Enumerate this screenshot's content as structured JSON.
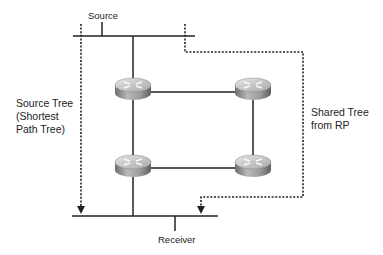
{
  "diagram": {
    "source_label": "Source",
    "receiver_label": "Receiver",
    "source_tree_label": [
      "Source Tree",
      "(Shortest",
      "Path Tree)"
    ],
    "shared_tree_label": [
      "Shared Tree",
      "from RP"
    ],
    "routers": [
      {
        "id": "router-top-left"
      },
      {
        "id": "router-top-right"
      },
      {
        "id": "router-bottom-left"
      },
      {
        "id": "router-bottom-right"
      }
    ],
    "colors": {
      "line": "#222222",
      "router_top": "#d8d8d8",
      "router_side": "#8a8a8a"
    }
  }
}
